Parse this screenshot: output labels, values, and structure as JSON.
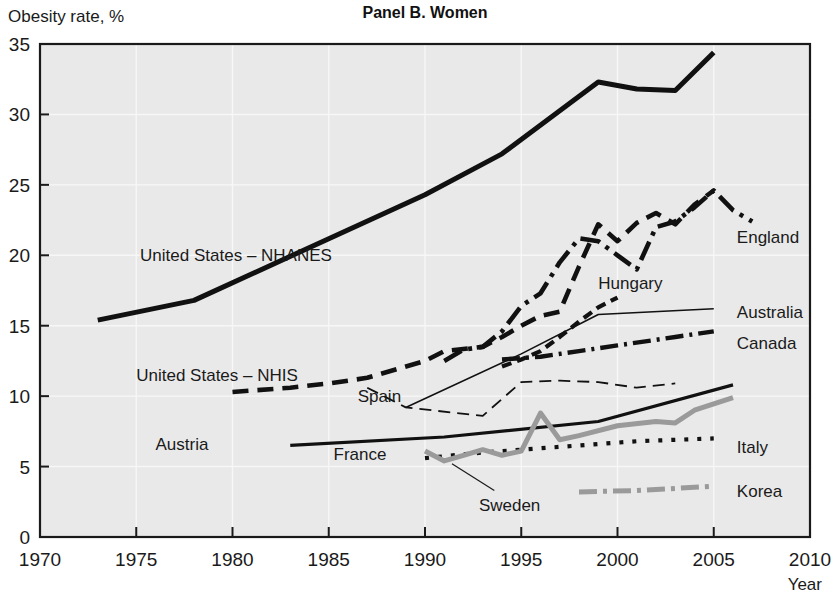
{
  "figure": {
    "title": "Panel B. Women",
    "ylabel": "Obesity rate, %",
    "xlabel": "Year"
  },
  "chart_data": {
    "type": "line",
    "title": "Panel B. Women",
    "xlabel": "Year",
    "ylabel": "Obesity rate, %",
    "xlim": [
      1970,
      2010
    ],
    "ylim": [
      0,
      35
    ],
    "xticks": [
      1970,
      1975,
      1980,
      1985,
      1990,
      1995,
      2000,
      2005,
      2010
    ],
    "yticks": [
      0,
      5,
      10,
      15,
      20,
      25,
      30,
      35
    ],
    "grid": true,
    "legend_position": "inline-labels",
    "series": [
      {
        "name": "United States – NHANES",
        "color": "#111111",
        "width": 5.0,
        "dash": "none",
        "label_x": 1975.2,
        "label_y": 20.0,
        "label_anchor": "start",
        "points": [
          [
            1973,
            15.4
          ],
          [
            1978,
            16.8
          ],
          [
            1990,
            24.3
          ],
          [
            1994,
            27.2
          ],
          [
            1999,
            32.3
          ],
          [
            2001,
            31.8
          ],
          [
            2003,
            31.7
          ],
          [
            2005,
            34.4
          ]
        ]
      },
      {
        "name": "United States – NHIS",
        "color": "#111111",
        "width": 4.6,
        "dash": "16,9",
        "label_x": 1975.0,
        "label_y": 11.5,
        "label_anchor": "start",
        "points": [
          [
            1980,
            10.3
          ],
          [
            1983,
            10.6
          ],
          [
            1985,
            10.9
          ],
          [
            1987,
            11.3
          ],
          [
            1990,
            12.5
          ],
          [
            1991,
            13.2
          ],
          [
            1993,
            13.5
          ],
          [
            1994,
            14.2
          ],
          [
            1995,
            15.0
          ],
          [
            1996,
            15.7
          ],
          [
            1997,
            16.0
          ],
          [
            1998,
            19.2
          ],
          [
            1999,
            22.2
          ],
          [
            2000,
            21.0
          ],
          [
            2001,
            22.3
          ],
          [
            2002,
            23.0
          ],
          [
            2003,
            22.2
          ],
          [
            2004,
            23.6
          ],
          [
            2005,
            24.6
          ]
        ]
      },
      {
        "name": "England",
        "color": "#111111",
        "width": 4.6,
        "dash": "20,7,4,7",
        "label_x": 2006.2,
        "label_y": 21.3,
        "label_anchor": "start",
        "points": [
          [
            1991,
            12.5
          ],
          [
            1992,
            13.3
          ],
          [
            1993,
            13.5
          ],
          [
            1994,
            14.6
          ],
          [
            1995,
            16.4
          ],
          [
            1996,
            17.3
          ],
          [
            1997,
            19.5
          ],
          [
            1998,
            21.2
          ],
          [
            1999,
            21.0
          ],
          [
            2000,
            20.0
          ],
          [
            2001,
            19.0
          ],
          [
            2002,
            22.0
          ],
          [
            2003,
            22.4
          ],
          [
            2004,
            23.4
          ],
          [
            2005,
            24.6
          ],
          [
            2006,
            23.2
          ],
          [
            2007,
            22.4
          ]
        ]
      },
      {
        "name": "Hungary",
        "color": "#111111",
        "width": 4.2,
        "dash": "10,6",
        "label_x": 1999.0,
        "label_y": 18.0,
        "label_anchor": "start",
        "points": [
          [
            1994,
            12.1
          ],
          [
            1995,
            12.6
          ],
          [
            1996,
            13.2
          ],
          [
            1997,
            14.2
          ],
          [
            1998,
            15.3
          ],
          [
            1999,
            16.3
          ],
          [
            2000,
            17.0
          ]
        ]
      },
      {
        "name": "Australia",
        "color": "#111111",
        "width": 1.6,
        "dash": "none",
        "label_x": 2006.2,
        "label_y": 16.0,
        "label_anchor": "start",
        "points": [
          [
            1989,
            9.2
          ],
          [
            1995,
            13.0
          ],
          [
            1999,
            15.8
          ],
          [
            2005,
            16.2
          ]
        ]
      },
      {
        "name": "Canada",
        "color": "#111111",
        "width": 4.4,
        "dash": "18,6,3,6",
        "label_x": 2006.2,
        "label_y": 13.8,
        "label_anchor": "start",
        "points": [
          [
            1994,
            12.6
          ],
          [
            1996,
            12.8
          ],
          [
            1998,
            13.2
          ],
          [
            2000,
            13.6
          ],
          [
            2003,
            14.2
          ],
          [
            2005,
            14.6
          ]
        ]
      },
      {
        "name": "Spain",
        "color": "#111111",
        "width": 1.8,
        "dash": "12,7",
        "label_x": 1986.5,
        "label_y": 10.0,
        "label_anchor": "start",
        "points": [
          [
            1987,
            10.6
          ],
          [
            1989,
            9.2
          ],
          [
            1993,
            8.6
          ],
          [
            1995,
            11.0
          ],
          [
            1997,
            11.1
          ],
          [
            1999,
            11.0
          ],
          [
            2001,
            10.6
          ],
          [
            2003,
            10.9
          ]
        ]
      },
      {
        "name": "Austria",
        "color": "#111111",
        "width": 3.2,
        "dash": "none",
        "label_x": 1976.0,
        "label_y": 6.6,
        "label_anchor": "start",
        "points": [
          [
            1983,
            6.5
          ],
          [
            1991,
            7.1
          ],
          [
            1999,
            8.2
          ],
          [
            2006,
            10.8
          ]
        ]
      },
      {
        "name": "Italy",
        "color": "#111111",
        "width": 4.2,
        "dash": "4,9",
        "label_x": 2006.2,
        "label_y": 6.4,
        "label_anchor": "start",
        "points": [
          [
            1990,
            5.6
          ],
          [
            1993,
            6.0
          ],
          [
            1995,
            6.2
          ],
          [
            1997,
            6.4
          ],
          [
            1999,
            6.6
          ],
          [
            2001,
            6.8
          ],
          [
            2003,
            6.9
          ],
          [
            2005,
            7.0
          ]
        ]
      },
      {
        "name": "France",
        "color": "#9a9a9a",
        "width": 5.0,
        "dash": "none",
        "label_x": 1988.0,
        "label_y": 5.9,
        "label_anchor": "end",
        "points": [
          [
            1990,
            6.1
          ],
          [
            1991,
            5.4
          ],
          [
            1992,
            5.8
          ],
          [
            1993,
            6.2
          ],
          [
            1994,
            5.8
          ],
          [
            1995,
            6.1
          ],
          [
            1996,
            8.8
          ],
          [
            1997,
            6.9
          ],
          [
            1998,
            7.2
          ],
          [
            2000,
            7.9
          ],
          [
            2002,
            8.2
          ],
          [
            2003,
            8.1
          ],
          [
            2004,
            9.0
          ],
          [
            2006,
            9.9
          ]
        ]
      },
      {
        "name": "Sweden",
        "color": "#9a9a9a",
        "width": 5.0,
        "dash": "none",
        "label_x": 1992.8,
        "label_y": 2.3,
        "label_anchor": "start",
        "points": []
      },
      {
        "name": "Korea",
        "color": "#9a9a9a",
        "width": 5.0,
        "dash": "18,6,4,6",
        "label_x": 2006.2,
        "label_y": 3.3,
        "label_anchor": "start",
        "points": [
          [
            1998,
            3.2
          ],
          [
            2001,
            3.3
          ],
          [
            2005,
            3.6
          ]
        ]
      }
    ],
    "annotations": [
      {
        "name": "sweden-leader",
        "from": [
          1993.6,
          3.3
        ],
        "to": [
          1991.4,
          5.2
        ]
      }
    ]
  }
}
